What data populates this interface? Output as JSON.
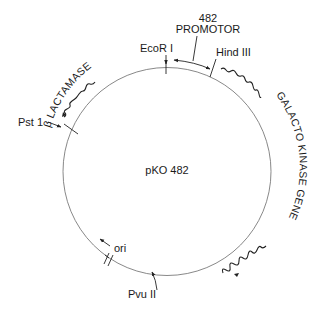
{
  "plasmid": {
    "name": "pKO 482",
    "ring_color": "#7a7a7a",
    "ink_color": "#1a1a1a"
  },
  "sites": {
    "ecori": "EcoR I",
    "hindiii": "Hind  III",
    "psti": "Pst 1",
    "pvuii": "Pvu  II",
    "ori": "ori"
  },
  "regions": {
    "promotor_number": "482",
    "promotor_label": "PROMOTOR",
    "beta_lactamase": "β LACTAMASE",
    "galacto_kinase": "GALACTO KINASE GENE"
  }
}
